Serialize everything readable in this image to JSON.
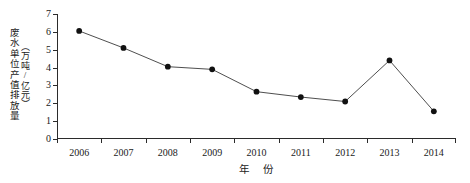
{
  "chart_data": {
    "type": "line",
    "title": "",
    "subtitle": "",
    "xlabel": "年　份",
    "ylabel": "废水单位产值排放量",
    "ylabel_unit": "（万吨/亿元）",
    "categories": [
      "2006",
      "2007",
      "2008",
      "2009",
      "2010",
      "2011",
      "2012",
      "2013",
      "2014"
    ],
    "values": [
      6.05,
      5.1,
      4.05,
      3.9,
      2.65,
      2.35,
      2.1,
      4.4,
      1.55
    ],
    "series": [
      {
        "name": "废水单位产值排放量",
        "values": [
          6.05,
          5.1,
          4.05,
          3.9,
          2.65,
          2.35,
          2.1,
          4.4,
          1.55
        ]
      }
    ],
    "ylim": [
      0,
      7
    ],
    "yticks": [
      "0",
      "1",
      "2",
      "3",
      "4",
      "5",
      "6",
      "7"
    ],
    "ytick_values": [
      0,
      1,
      2,
      3,
      4,
      5,
      6,
      7
    ],
    "xtick_labels": [
      "2006",
      "2007",
      "2008",
      "2009",
      "2010",
      "2011",
      "2012",
      "2013",
      "2014"
    ],
    "grid": false,
    "legend": "none",
    "marker": "filled-circle",
    "marker_color": "#111111",
    "line_color": "#3a3a3a",
    "background": "#ffffff",
    "axis_color": "#2b2b2b"
  }
}
